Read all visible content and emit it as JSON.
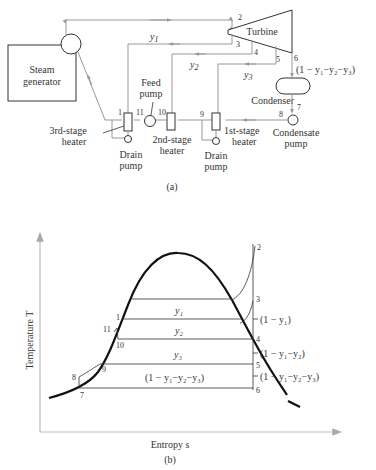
{
  "diagram_a": {
    "caption": "(a)",
    "components": {
      "steam_generator": [
        "Steam",
        "generator"
      ],
      "turbine": "Turbine",
      "condenser": "Condenser",
      "condensate_pump": [
        "Condensate",
        "pump"
      ],
      "feed_pump": [
        "Feed",
        "pump"
      ],
      "heater_1": [
        "1st-stage",
        "heater"
      ],
      "heater_2": [
        "2nd-stage",
        "heater"
      ],
      "heater_3": [
        "3rd-stage",
        "heater"
      ],
      "drain_pump_left": [
        "Drain",
        "pump"
      ],
      "drain_pump_right": [
        "Drain",
        "pump"
      ]
    },
    "state_points": [
      "1",
      "2",
      "3",
      "4",
      "5",
      "6",
      "7",
      "8",
      "9",
      "10",
      "11"
    ],
    "flows": {
      "y1": "y",
      "y1_sub": "1",
      "y2": "y",
      "y2_sub": "2",
      "y3": "y",
      "y3_sub": "3",
      "exhaust": "(1 − y₁−y₂−y₃)"
    }
  },
  "diagram_b": {
    "caption": "(b)",
    "y_axis_label": "Temperature T",
    "x_axis_label": "Entropy s",
    "state_points": [
      "1",
      "2",
      "3",
      "4",
      "5",
      "6",
      "7",
      "8",
      "9",
      "10",
      "11"
    ],
    "band_labels": {
      "y1": "y₁",
      "y2": "y₂",
      "y3": "y₃",
      "remainder": "(1 − y₁−y₂−y₃)"
    },
    "right_labels": {
      "after_3": "(1 − y₁)",
      "after_4": "(1 − y₁−y₂)",
      "after_5": "(1 − y₁−y₂−y₃)"
    }
  }
}
